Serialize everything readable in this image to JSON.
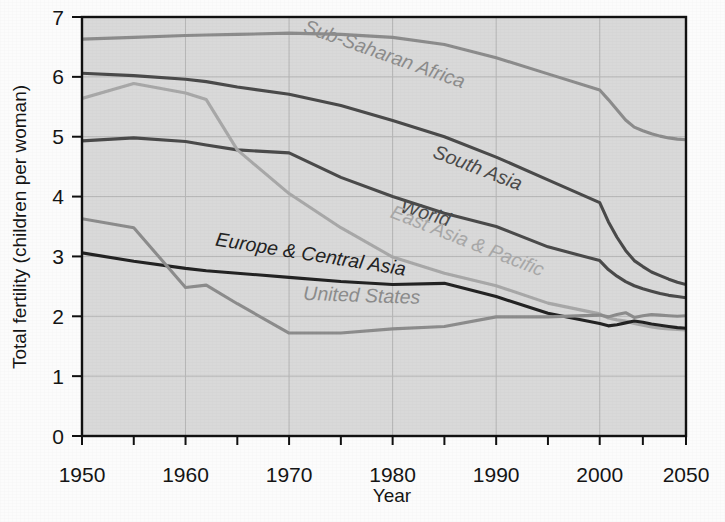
{
  "chart_data": {
    "type": "line",
    "title": "",
    "xlabel": "Year",
    "ylabel": "Total fertility (children per woman)",
    "xlim": [
      1950,
      2050
    ],
    "ylim": [
      0,
      7
    ],
    "grid": true,
    "legend_position": "inline-labels",
    "plot_background": "#d9d9d9",
    "xtick_labels": [
      "1950",
      "1960",
      "1970",
      "1980",
      "1990",
      "2000",
      "2050"
    ],
    "xtick_values": [
      1950,
      1960,
      1970,
      1980,
      1990,
      2000,
      2050
    ],
    "xminor_step_years": 5,
    "ytick_labels": [
      "0",
      "1",
      "2",
      "3",
      "4",
      "5",
      "6",
      "7"
    ],
    "ytick_values": [
      0,
      1,
      2,
      3,
      4,
      5,
      6,
      7
    ],
    "x": [
      1950,
      1955,
      1960,
      1962,
      1965,
      1970,
      1975,
      1980,
      1985,
      1990,
      1995,
      2000,
      2005,
      2010,
      2015,
      2020,
      2025,
      2030,
      2035,
      2040,
      2045,
      2050
    ],
    "series": [
      {
        "name": "Sub-Saharan Africa",
        "color": "#8c8c8c",
        "label_x": 1979,
        "label_y": 6.28,
        "label_angle": 19.5,
        "values": [
          6.63,
          6.66,
          6.69,
          6.7,
          6.71,
          6.73,
          6.71,
          6.66,
          6.54,
          6.32,
          6.05,
          5.78,
          5.62,
          5.45,
          5.28,
          5.16,
          5.1,
          5.05,
          5.01,
          4.98,
          4.96,
          4.95
        ]
      },
      {
        "name": "South Asia",
        "color": "#4a4a4a",
        "label_x": 1988,
        "label_y": 4.38,
        "label_angle": 21.0,
        "values": [
          6.06,
          6.02,
          5.96,
          5.92,
          5.83,
          5.71,
          5.52,
          5.27,
          5.0,
          4.66,
          4.28,
          3.9,
          3.58,
          3.32,
          3.1,
          2.93,
          2.83,
          2.74,
          2.68,
          2.62,
          2.57,
          2.53
        ]
      },
      {
        "name": "World",
        "color": "#4a4a4a",
        "label_x": 1983,
        "label_y": 3.62,
        "label_angle": 16.5,
        "values": [
          4.93,
          4.98,
          4.92,
          4.86,
          4.78,
          4.73,
          4.32,
          4.0,
          3.72,
          3.5,
          3.16,
          2.93,
          2.78,
          2.67,
          2.58,
          2.51,
          2.46,
          2.42,
          2.38,
          2.35,
          2.33,
          2.31
        ]
      },
      {
        "name": "East Asia & Pacific",
        "color": "#a8a8a8",
        "label_x": 1987,
        "label_y": 3.16,
        "label_angle": 21.5,
        "values": [
          5.64,
          5.89,
          5.73,
          5.62,
          4.78,
          4.05,
          3.48,
          2.99,
          2.72,
          2.51,
          2.22,
          2.04,
          1.97,
          1.94,
          1.92,
          1.88,
          1.85,
          1.82,
          1.8,
          1.79,
          1.78,
          1.77
        ]
      },
      {
        "name": "Europe & Central Asia",
        "color": "#232323",
        "label_x": 1972,
        "label_y": 2.93,
        "label_angle": 9.0,
        "values": [
          3.06,
          2.92,
          2.8,
          2.76,
          2.72,
          2.65,
          2.58,
          2.53,
          2.55,
          2.33,
          2.05,
          1.88,
          1.84,
          1.86,
          1.89,
          1.92,
          1.9,
          1.87,
          1.85,
          1.83,
          1.81,
          1.8
        ]
      },
      {
        "name": "United States",
        "color": "#8c8c8c",
        "label_x": 1977,
        "label_y": 2.24,
        "label_angle": 2.0,
        "values": [
          3.63,
          3.48,
          2.48,
          2.52,
          2.21,
          1.72,
          1.72,
          1.79,
          1.83,
          1.99,
          1.99,
          2.02,
          1.99,
          2.03,
          2.06,
          1.98,
          2.01,
          2.03,
          2.02,
          2.01,
          2.0,
          2.01
        ]
      }
    ]
  }
}
